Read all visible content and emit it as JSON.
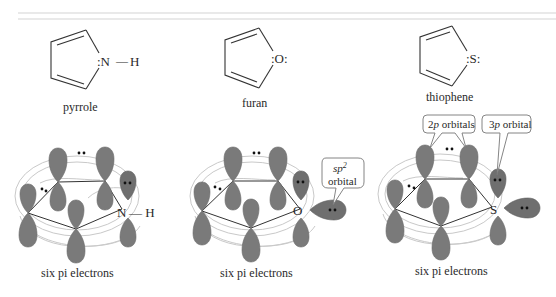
{
  "figure": {
    "header_rule": {
      "color": "#d0d0d0"
    },
    "molecules": [
      {
        "name": "pyrrole",
        "label": "pyrrole",
        "heteroatom": "N",
        "heteroatom_label": ":N",
        "substituent_bond": "—",
        "substituent": "H",
        "orbital_caption": "six pi electrons",
        "orbital_heteroatom": "N",
        "orbital_substituent": "— H"
      },
      {
        "name": "furan",
        "label": "furan",
        "heteroatom": "O",
        "heteroatom_label": ":O:",
        "orbital_caption": "six pi electrons",
        "orbital_heteroatom": "O",
        "callout": {
          "line1": "sp",
          "line1_sup": "2",
          "line2": "orbital"
        }
      },
      {
        "name": "thiophene",
        "label": "thiophene",
        "heteroatom": "S",
        "heteroatom_label": ":S:",
        "orbital_caption": "six pi electrons",
        "orbital_heteroatom": "S",
        "callouts": [
          {
            "prefix": "2",
            "italic": "p",
            "suffix": " orbitals"
          },
          {
            "prefix": "3",
            "italic": "p",
            "suffix": " orbital"
          }
        ]
      }
    ],
    "colors": {
      "lobe": "#7a7a7a",
      "ring_lines": "#c9c9c9",
      "bond": "#333333",
      "electron_dot": "#111111"
    }
  }
}
